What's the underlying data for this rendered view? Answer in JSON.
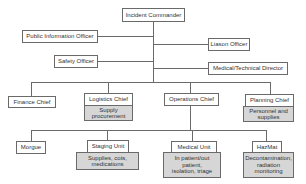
{
  "chart": {
    "title_node": "Incident Commander",
    "staff": {
      "public_information": "Public Information Officer",
      "liaison": "Liason Officer",
      "safety": "Safety Officer",
      "medical_technical": "Medical/Technical Director"
    },
    "chiefs": [
      {
        "label": "Finance Chief"
      },
      {
        "label": "Logistics Chief",
        "note": "Supply\nprocurement"
      },
      {
        "label": "Operations Chief"
      },
      {
        "label": "Planning Chief",
        "note": "Personnel and\nsupplies"
      }
    ],
    "units": [
      {
        "label": "Morgue"
      },
      {
        "label": "Staging Unit",
        "note": "Supplies, cots,\nmedications"
      },
      {
        "label": "Medical Unit",
        "note": "In patient/out\npatient,\nisolation, triage"
      },
      {
        "label": "HazMat",
        "note": "Decontamination,\nradiation\nmonitoring"
      }
    ]
  },
  "colors": {
    "line": "#6a6a6a",
    "note_fill": "#d6d6d6"
  }
}
